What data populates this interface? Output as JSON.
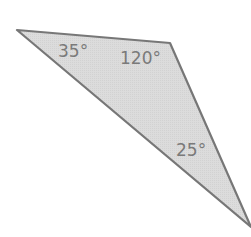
{
  "diagram": {
    "type": "triangle",
    "fill_color": "#d9d9d9",
    "stroke_color": "#777777",
    "vertices": {
      "top_left": [
        17,
        30
      ],
      "top_right": [
        170,
        43
      ],
      "bottom_right": [
        251,
        227
      ]
    },
    "angles": [
      {
        "vertex": "top_left",
        "label": "35°"
      },
      {
        "vertex": "top_right",
        "label": "120°"
      },
      {
        "vertex": "bottom_right",
        "label": "25°"
      }
    ]
  }
}
